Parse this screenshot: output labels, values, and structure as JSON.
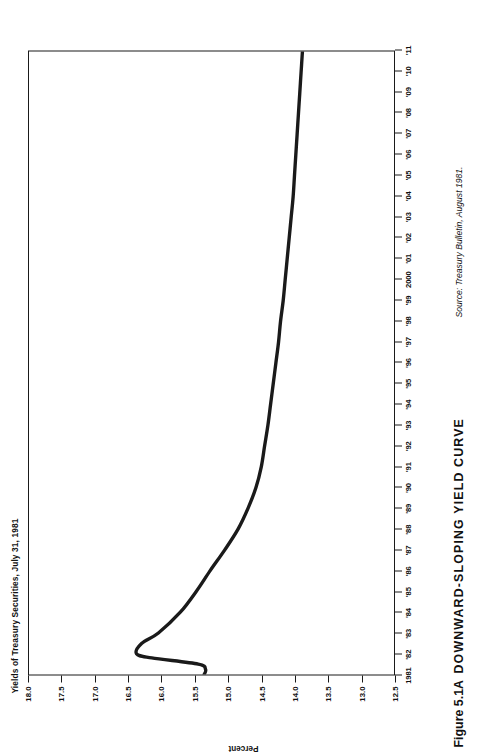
{
  "figure": {
    "chart_title": "Yields of Treasury Securities, July 31, 1981",
    "caption_number": "Figure 5.1A",
    "caption_title": "DOWNWARD-SLOPING YIELD CURVE",
    "source_note": "Source: Treasury Bulletin, August 1981.",
    "orientation_note": "rotated-90-ccw"
  },
  "chart_data": {
    "type": "line",
    "title": "Yields of Treasury Securities, July 31, 1981",
    "xlabel": "",
    "ylabel": "Percent",
    "ylim": [
      12.5,
      18.0
    ],
    "xlim": [
      1981,
      2011
    ],
    "grid": false,
    "legend": null,
    "line_color": "#1a1a1a",
    "x_tick_labels": [
      "1981",
      "'82",
      "'83",
      "'84",
      "'85",
      "'86",
      "'87",
      "'88",
      "'89",
      "'90",
      "'91",
      "'92",
      "'93",
      "'94",
      "'95",
      "'96",
      "'97",
      "'98",
      "'99",
      "2000",
      "'01",
      "'02",
      "'03",
      "'04",
      "'05",
      "'06",
      "'07",
      "'08",
      "'09",
      "'10",
      "'11"
    ],
    "x_tick_values": [
      1981,
      1982,
      1983,
      1984,
      1985,
      1986,
      1987,
      1988,
      1989,
      1990,
      1991,
      1992,
      1993,
      1994,
      1995,
      1996,
      1997,
      1998,
      1999,
      2000,
      2001,
      2002,
      2003,
      2004,
      2005,
      2006,
      2007,
      2008,
      2009,
      2010,
      2011
    ],
    "y_tick_labels": [
      "18.0",
      "17.5",
      "17.0",
      "16.5",
      "16.0",
      "15.5",
      "15.0",
      "14.5",
      "14.0",
      "13.5",
      "13.0",
      "12.5"
    ],
    "y_tick_values": [
      18.0,
      17.5,
      17.0,
      16.5,
      16.0,
      15.5,
      15.0,
      14.5,
      14.0,
      13.5,
      13.0,
      12.5
    ],
    "series": [
      {
        "name": "Treasury yield curve",
        "x": [
          1981.0,
          1981.25,
          1981.5,
          1981.8,
          1982.0,
          1982.5,
          1983.0,
          1984.0,
          1985.0,
          1986.0,
          1987.0,
          1988.0,
          1989.0,
          1990.0,
          1991.0,
          1992.0,
          1993.0,
          1994.0,
          1995.0,
          1996.0,
          1997.0,
          1998.0,
          1999.0,
          2000.0,
          2001.0,
          2002.0,
          2003.0,
          2004.0,
          2005.0,
          2006.0,
          2007.0,
          2008.0,
          2009.0,
          2010.0,
          2011.0
        ],
        "y": [
          15.36,
          15.34,
          15.45,
          16.15,
          16.38,
          16.3,
          16.05,
          15.72,
          15.48,
          15.27,
          15.05,
          14.85,
          14.7,
          14.58,
          14.5,
          14.45,
          14.4,
          14.36,
          14.32,
          14.28,
          14.24,
          14.21,
          14.17,
          14.14,
          14.11,
          14.08,
          14.05,
          14.02,
          14.0,
          13.98,
          13.96,
          13.94,
          13.92,
          13.9,
          13.88
        ]
      }
    ],
    "annotations": []
  }
}
